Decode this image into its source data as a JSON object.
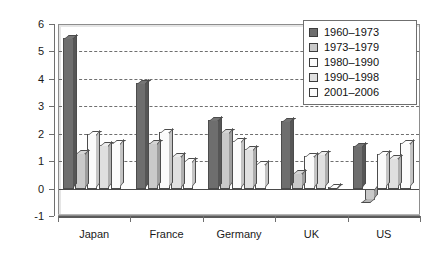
{
  "chart_data": {
    "type": "bar",
    "title": "",
    "subtitle": "",
    "xlabel": "",
    "ylabel": "",
    "categories": [
      "Japan",
      "France",
      "Germany",
      "UK",
      "US"
    ],
    "ylim": [
      -1,
      6
    ],
    "yticks": [
      -1,
      0,
      1,
      2,
      3,
      4,
      5,
      6
    ],
    "ytick_labels": [
      "-1",
      "0",
      "1",
      "2",
      "3",
      "4",
      "5",
      "6"
    ],
    "grid": true,
    "grid_axis": "y",
    "legend_position": "top-right",
    "series": [
      {
        "name": "1960–1973",
        "color": "#6e6e6e",
        "values": [
          5.5,
          3.85,
          2.5,
          2.45,
          1.55
        ]
      },
      {
        "name": "1973–1979",
        "color": "#c9c9c9",
        "values": [
          1.3,
          1.65,
          2.05,
          0.55,
          -0.4
        ]
      },
      {
        "name": "1980–1990",
        "color": "#fbfbfb",
        "values": [
          2.0,
          2.05,
          1.75,
          1.2,
          1.25
        ]
      },
      {
        "name": "1990–1998",
        "color": "#e0e0e0",
        "values": [
          1.6,
          1.2,
          1.45,
          1.25,
          1.1
        ]
      },
      {
        "name": "2001–2006",
        "color": "#fbfbfb",
        "values": [
          1.65,
          1.0,
          0.9,
          0.05,
          1.65
        ]
      }
    ]
  }
}
